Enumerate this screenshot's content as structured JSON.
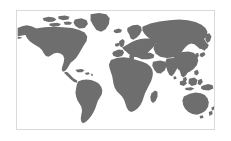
{
  "figure": {
    "kind": "world-map-image",
    "title": "",
    "caption": "",
    "projection": "equirectangular",
    "background_color": "#ffffff",
    "border_color": "#d9d9d9",
    "land_color": "#6e6e6e",
    "ocean_color": "#ffffff",
    "labels_visible": "none",
    "graticule_visible": "none",
    "antarctica_included": "no",
    "frame": {
      "x": 16,
      "y": 10,
      "width": 199,
      "height": 120
    }
  },
  "map_data": {
    "type": "choropleth-silhouette",
    "legend": [],
    "regions": [
      {
        "name": "North America",
        "label": "",
        "value": ""
      },
      {
        "name": "Greenland",
        "label": "",
        "value": ""
      },
      {
        "name": "Canadian Arctic Archipelago",
        "label": "",
        "value": ""
      },
      {
        "name": "Central America",
        "label": "",
        "value": ""
      },
      {
        "name": "Caribbean",
        "label": "",
        "value": ""
      },
      {
        "name": "South America",
        "label": "",
        "value": ""
      },
      {
        "name": "Europe",
        "label": "",
        "value": ""
      },
      {
        "name": "British Isles",
        "label": "",
        "value": ""
      },
      {
        "name": "Scandinavia",
        "label": "",
        "value": ""
      },
      {
        "name": "Iceland",
        "label": "",
        "value": ""
      },
      {
        "name": "Africa",
        "label": "",
        "value": ""
      },
      {
        "name": "Madagascar",
        "label": "",
        "value": ""
      },
      {
        "name": "Middle East",
        "label": "",
        "value": ""
      },
      {
        "name": "Russia and Siberia",
        "label": "",
        "value": ""
      },
      {
        "name": "Central Asia",
        "label": "",
        "value": ""
      },
      {
        "name": "India",
        "label": "",
        "value": ""
      },
      {
        "name": "China and East Asia",
        "label": "",
        "value": ""
      },
      {
        "name": "Japan",
        "label": "",
        "value": ""
      },
      {
        "name": "Southeast Asia",
        "label": "",
        "value": ""
      },
      {
        "name": "Indonesia",
        "label": "",
        "value": ""
      },
      {
        "name": "Philippines",
        "label": "",
        "value": ""
      },
      {
        "name": "New Guinea",
        "label": "",
        "value": ""
      },
      {
        "name": "Australia",
        "label": "",
        "value": ""
      },
      {
        "name": "New Zealand",
        "label": "",
        "value": ""
      }
    ]
  }
}
